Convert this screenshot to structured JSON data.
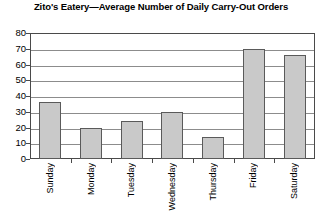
{
  "chart_data": {
    "type": "bar",
    "title": "Zito's Eatery—Average Number of Daily Carry-Out Orders",
    "xlabel": "",
    "ylabel": "",
    "categories": [
      "Sunday",
      "Monday",
      "Tuesday",
      "Wednesday",
      "Thursday",
      "Friday",
      "Saturday"
    ],
    "values": [
      36,
      20,
      24,
      30,
      14,
      70,
      66
    ],
    "ylim": [
      0,
      80
    ],
    "ytick_labels": [
      "80",
      "70",
      "60",
      "50",
      "40",
      "30",
      "20",
      "10",
      "0"
    ],
    "ytick_values": [
      80,
      70,
      60,
      50,
      40,
      30,
      20,
      10,
      0
    ],
    "grid": true,
    "legend": false,
    "bar_fill_color": "#c9c9c9",
    "bar_border_color": "#5a5a5a",
    "gridline_color": "#8c8c8c",
    "frame_color": "#4a4a4a",
    "background_color": "#ffffff",
    "xtick_label_rotation": 90
  }
}
